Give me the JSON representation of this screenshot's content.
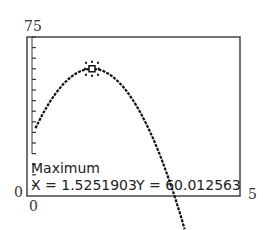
{
  "chart_data": {
    "type": "line",
    "title": "",
    "xlabel": "",
    "ylabel": "",
    "xlim": [
      0,
      5
    ],
    "ylim": [
      0,
      75
    ],
    "x_tick_labels": {
      "xmin": "0",
      "xmax": "5"
    },
    "y_tick_labels": {
      "ymin": "0",
      "ymax": "75"
    },
    "y_tick_count": 15,
    "series": [
      {
        "name": "curve",
        "equation_approx": "y = 60.012563 - 16*(x - 1.5251903)^2",
        "x_range": [
          0.2,
          3.7
        ]
      }
    ],
    "annotation": {
      "label": "Maximum",
      "x": "1.5251903",
      "y": "60.012563"
    }
  },
  "labels": {
    "ymax": "75",
    "ymin": "0",
    "xmin": "0",
    "xmax": "5"
  },
  "readout": {
    "title": "Maximum",
    "x_text": "X = 1.5251903",
    "y_text": "Y = 60.012563"
  }
}
